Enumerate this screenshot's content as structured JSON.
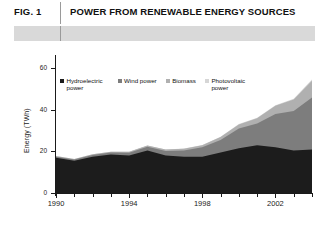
{
  "header": {
    "fig_label": "FIG. 1",
    "title": "POWER FROM RENEWABLE ENERGY SOURCES"
  },
  "legend": {
    "items": [
      {
        "label": "Hydroelectric power",
        "color": "#1c1c1c"
      },
      {
        "label": "Wind power",
        "color": "#7d7d7d"
      },
      {
        "label": "Biomass",
        "color": "#b0b0b0"
      },
      {
        "label": "Photovoltaic power",
        "color": "#d6d6d6"
      }
    ]
  },
  "chart_data": {
    "type": "area",
    "title": "POWER FROM RENEWABLE ENERGY SOURCES",
    "xlabel": "",
    "ylabel": "Energy (TWh)",
    "ylim": [
      0,
      65
    ],
    "yticks": [
      0,
      20,
      40,
      60
    ],
    "ytick_labels": [
      "0",
      "20",
      "40",
      "60"
    ],
    "xlim": [
      1990,
      2004
    ],
    "xticks": [
      1990,
      1994,
      1998,
      2002
    ],
    "xtick_labels": [
      "1990",
      "1994",
      "1998",
      "2002"
    ],
    "grid": false,
    "legend_position": "top-left-inside",
    "stacked": true,
    "x": [
      1990,
      1991,
      1992,
      1993,
      1994,
      1995,
      1996,
      1997,
      1998,
      1999,
      2000,
      2001,
      2002,
      2003,
      2004
    ],
    "series": [
      {
        "name": "Hydroelectric power",
        "color": "#1c1c1c",
        "values": [
          17.0,
          15.5,
          17.5,
          18.5,
          18.0,
          20.5,
          18.0,
          17.5,
          17.5,
          19.5,
          21.5,
          23.0,
          22.0,
          20.5,
          21.0
        ]
      },
      {
        "name": "Wind power",
        "color": "#7d7d7d",
        "values": [
          0.5,
          0.6,
          0.8,
          1.0,
          1.4,
          1.8,
          2.2,
          3.0,
          4.5,
          6.0,
          9.5,
          10.5,
          16.0,
          19.0,
          25.0
        ]
      },
      {
        "name": "Biomass",
        "color": "#b0b0b0",
        "values": [
          0.3,
          0.3,
          0.4,
          0.4,
          0.5,
          0.6,
          0.7,
          0.8,
          1.0,
          1.5,
          2.0,
          2.5,
          4.0,
          5.5,
          8.0
        ]
      },
      {
        "name": "Photovoltaic power",
        "color": "#d6d6d6",
        "values": [
          0.0,
          0.0,
          0.0,
          0.0,
          0.0,
          0.0,
          0.0,
          0.1,
          0.1,
          0.1,
          0.2,
          0.2,
          0.3,
          0.4,
          0.6
        ]
      }
    ]
  }
}
